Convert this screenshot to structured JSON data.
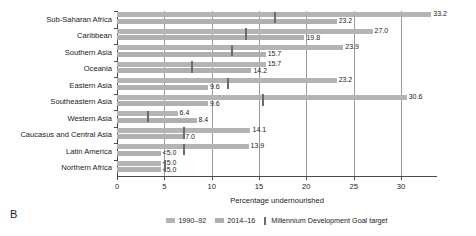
{
  "panel": {
    "letter": "B"
  },
  "chart_data": {
    "type": "bar",
    "orientation": "horizontal",
    "title": "",
    "xlabel": "Percentage undernourished",
    "ylabel": "",
    "xlim": [
      0,
      33.8
    ],
    "xticks": [
      0,
      5,
      10,
      15,
      20,
      25,
      30
    ],
    "xticklabels": [
      "0",
      "5",
      "10",
      "15",
      "20",
      "25",
      "30"
    ],
    "grid": "vertical",
    "legend_position": "bottom-center",
    "categories": [
      "Sub-Saharan Africa",
      "Caribbean",
      "Southern Asia",
      "Oceania",
      "Eastern Asia",
      "Southeastern Asia",
      "Western Asia",
      "Caucasus and Central Asia",
      "Latin America",
      "Northern Africa"
    ],
    "series": [
      {
        "name": "1990–92",
        "color": "#b4b4b4",
        "values": [
          33.2,
          27.0,
          23.9,
          15.7,
          23.2,
          30.6,
          6.4,
          14.1,
          13.9,
          4.6
        ],
        "labels": [
          "33.2",
          "27.0",
          "23.9",
          "15.7",
          "23.2",
          "30.6",
          "6.4",
          "14.1",
          "13.9",
          "<5.0"
        ]
      },
      {
        "name": "2014–16",
        "color": "#b0b0b0",
        "values": [
          23.2,
          19.8,
          15.7,
          14.2,
          9.6,
          9.6,
          8.4,
          7.0,
          4.6,
          4.6
        ],
        "labels": [
          "23.2",
          "19.8",
          "15.7",
          "14.2",
          "9.6",
          "9.6",
          "8.4",
          "7.0",
          "<5.0",
          "<5.0"
        ]
      }
    ],
    "markers": {
      "name": "Millennium Development Goal target",
      "color": "#6b6b6b",
      "values": [
        16.6,
        13.5,
        12.0,
        7.8,
        11.6,
        15.3,
        3.2,
        7.0,
        7.0,
        5.0
      ]
    }
  }
}
